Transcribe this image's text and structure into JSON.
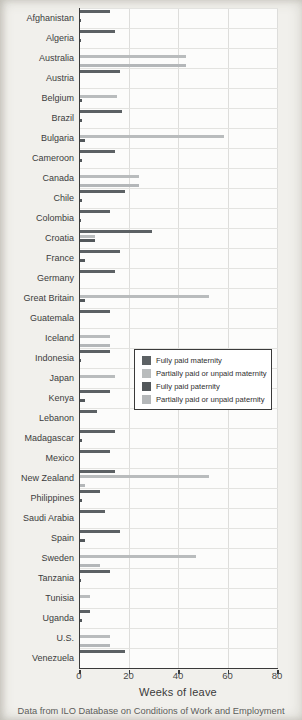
{
  "page": {
    "xlabel": "Weeks of leave",
    "caption": "Data from ILO Database on Conditions of Work and Employment"
  },
  "chart_data": {
    "type": "bar",
    "orientation": "horizontal",
    "xlabel": "Weeks of leave",
    "xlim": [
      0,
      80
    ],
    "x_ticks": [
      0,
      20,
      40,
      60,
      80
    ],
    "grid": "on",
    "legend_position": "inside-middle-right",
    "series": [
      {
        "key": "m_full",
        "label": "Fully paid maternity",
        "color": "#5c6164"
      },
      {
        "key": "m_partial",
        "label": "Partially paid or unpaid maternity",
        "color": "#b9bcbd"
      },
      {
        "key": "p_full",
        "label": "Fully paid paternity",
        "color": "#52575a"
      },
      {
        "key": "p_partial",
        "label": "Partially paid or unpaid paternity",
        "color": "#b4b7b9"
      }
    ],
    "value_unit": "weeks",
    "countries": [
      {
        "name": "Afghanistan",
        "m_full": 12,
        "p_full": 0.5
      },
      {
        "name": "Algeria",
        "m_full": 14,
        "p_full": 0.5
      },
      {
        "name": "Australia",
        "m_partial": 43,
        "p_partial": 43
      },
      {
        "name": "Austria",
        "m_full": 16
      },
      {
        "name": "Belgium",
        "m_partial": 15,
        "p_full": 1
      },
      {
        "name": "Brazil",
        "m_full": 17,
        "p_full": 1
      },
      {
        "name": "Bulgaria",
        "m_partial": 58,
        "p_full": 2
      },
      {
        "name": "Cameroon",
        "m_full": 14,
        "p_full": 1
      },
      {
        "name": "Canada",
        "m_partial": 24,
        "p_partial": 24
      },
      {
        "name": "Chile",
        "m_full": 18,
        "p_full": 1
      },
      {
        "name": "Colombia",
        "m_full": 12,
        "p_full": 0.5
      },
      {
        "name": "Croatia",
        "m_full": 29,
        "m_partial": 6,
        "p_full": 6
      },
      {
        "name": "France",
        "m_full": 16,
        "p_full": 2
      },
      {
        "name": "Germany",
        "m_full": 14
      },
      {
        "name": "Great Britain",
        "m_partial": 52,
        "p_full": 2
      },
      {
        "name": "Guatemala",
        "m_full": 12
      },
      {
        "name": "Iceland",
        "m_partial": 12,
        "p_partial": 12
      },
      {
        "name": "Indonesia",
        "m_full": 12,
        "p_full": 0.5
      },
      {
        "name": "Japan",
        "m_partial": 14
      },
      {
        "name": "Kenya",
        "m_full": 12,
        "p_full": 2
      },
      {
        "name": "Lebanon",
        "m_full": 7
      },
      {
        "name": "Madagascar",
        "m_full": 14,
        "p_full": 1
      },
      {
        "name": "Mexico",
        "m_full": 12
      },
      {
        "name": "New Zealand",
        "m_full": 14,
        "m_partial": 52,
        "p_partial": 2
      },
      {
        "name": "Philippines",
        "m_full": 8,
        "p_full": 1
      },
      {
        "name": "Saudi Arabia",
        "m_full": 10
      },
      {
        "name": "Spain",
        "m_full": 16,
        "p_full": 2
      },
      {
        "name": "Sweden",
        "m_partial": 47,
        "p_partial": 8
      },
      {
        "name": "Tanzania",
        "m_full": 12,
        "p_full": 0.5
      },
      {
        "name": "Tunisia",
        "m_partial": 4
      },
      {
        "name": "Uganda",
        "m_full": 4,
        "p_full": 1
      },
      {
        "name": "U.S.",
        "m_partial": 12,
        "p_partial": 12
      },
      {
        "name": "Venezuela",
        "m_full": 18
      }
    ]
  }
}
